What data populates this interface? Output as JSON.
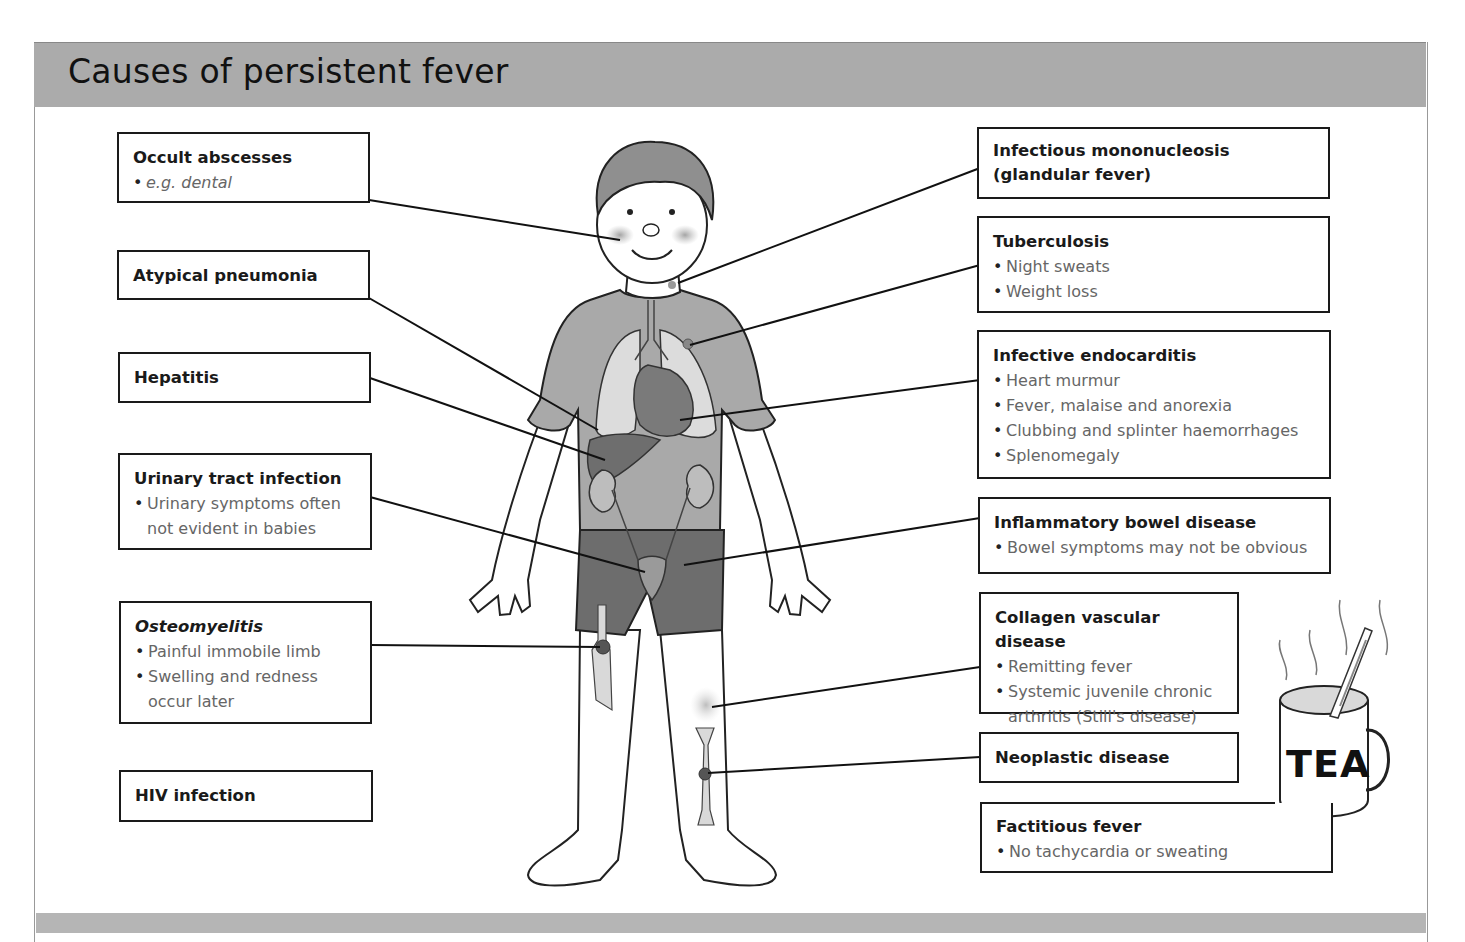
{
  "title": "Causes of persistent fever",
  "left_causes": [
    {
      "id": "occult-abscesses",
      "title": "Occult abscesses",
      "bullets": [
        "e.g. dental"
      ]
    },
    {
      "id": "atypical-pneumonia",
      "title": "Atypical pneumonia",
      "bullets": []
    },
    {
      "id": "hepatitis",
      "title": "Hepatitis",
      "bullets": []
    },
    {
      "id": "urinary-tract-infection",
      "title": "Urinary tract infection",
      "bullets": [
        "Urinary symptoms often not evident in babies"
      ]
    },
    {
      "id": "osteomyelitis",
      "title": "Osteomyelitis",
      "bullets": [
        "Painful immobile limb",
        "Swelling and redness occur later"
      ]
    },
    {
      "id": "hiv-infection",
      "title": "HIV infection",
      "bullets": []
    }
  ],
  "right_causes": [
    {
      "id": "infectious-mononucleosis",
      "title": "Infectious mononucleosis\n(glandular fever)",
      "bullets": []
    },
    {
      "id": "tuberculosis",
      "title": "Tuberculosis",
      "bullets": [
        "Night sweats",
        "Weight loss"
      ]
    },
    {
      "id": "infective-endocarditis",
      "title": "Infective endocarditis",
      "bullets": [
        "Heart murmur",
        "Fever, malaise and anorexia",
        "Clubbing and splinter haemorrhages",
        "Splenomegaly"
      ]
    },
    {
      "id": "inflammatory-bowel-disease",
      "title": "Inflammatory bowel disease",
      "bullets": [
        "Bowel symptoms may not be obvious"
      ]
    },
    {
      "id": "collagen-vascular-disease",
      "title": "Collagen vascular disease",
      "bullets": [
        "Remitting fever",
        "Systemic juvenile chronic arthritis (Still's disease)"
      ]
    },
    {
      "id": "neoplastic-disease",
      "title": "Neoplastic disease",
      "bullets": []
    },
    {
      "id": "factitious-fever",
      "title": "Factitious fever",
      "bullets": [
        "No tachycardia or sweating"
      ]
    }
  ],
  "mug_label": "TEA",
  "colors": {
    "header_band": "#ababab",
    "box_border": "#1a1a1a",
    "bullet_text": "#666666",
    "shirt": "#a9a9a9",
    "shorts": "#6d6d6d"
  }
}
